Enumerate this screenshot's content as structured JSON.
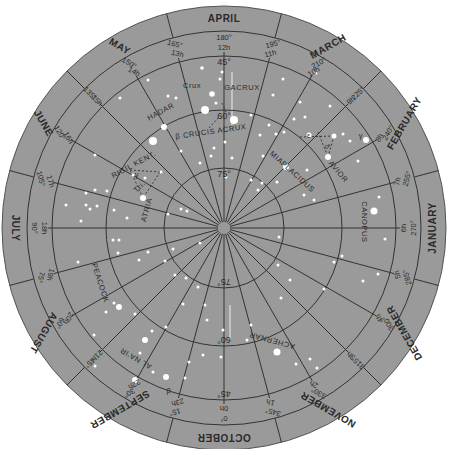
{
  "chart": {
    "center": {
      "x": 224,
      "y": 228
    },
    "colors": {
      "disc": "#9a9a9a",
      "lines": "#333333",
      "stars": "#ffffff",
      "labels": "#2a2a2a",
      "background": "#ffffff"
    },
    "months": [
      {
        "label": "APRIL",
        "angle": 180
      },
      {
        "label": "MARCH",
        "angle": 210
      },
      {
        "label": "FEBRUARY",
        "angle": 240
      },
      {
        "label": "JANUARY",
        "angle": 270
      },
      {
        "label": "DECEMBER",
        "angle": 300
      },
      {
        "label": "NOVEMBER",
        "angle": 330
      },
      {
        "label": "OCTOBER",
        "angle": 0
      },
      {
        "label": "SEPTEMBER",
        "angle": 30
      },
      {
        "label": "AUGUST",
        "angle": 60
      },
      {
        "label": "JULY",
        "angle": 90
      },
      {
        "label": "JUNE",
        "angle": 120
      },
      {
        "label": "MAY",
        "angle": 150
      }
    ],
    "ra_labels": [
      {
        "deg": "0°",
        "hr": "0h",
        "angle": 0
      },
      {
        "deg": "15°",
        "hr": "23h",
        "angle": 15
      },
      {
        "deg": "30°",
        "hr": "22h",
        "angle": 30
      },
      {
        "deg": "45°",
        "hr": "21h",
        "angle": 45
      },
      {
        "deg": "60°",
        "hr": "20h",
        "angle": 60
      },
      {
        "deg": "75°",
        "hr": "19h",
        "angle": 75
      },
      {
        "deg": "90°",
        "hr": "18h",
        "angle": 90
      },
      {
        "deg": "105°",
        "hr": "17h",
        "angle": 105
      },
      {
        "deg": "120°",
        "hr": "16h",
        "angle": 120
      },
      {
        "deg": "135°",
        "hr": "15h",
        "angle": 135
      },
      {
        "deg": "150°",
        "hr": "14h",
        "angle": 150
      },
      {
        "deg": "165°",
        "hr": "13h",
        "angle": 165
      },
      {
        "deg": "180°",
        "hr": "12h",
        "angle": 180
      },
      {
        "deg": "195°",
        "hr": "11h",
        "angle": 195
      },
      {
        "deg": "210°",
        "hr": "10h",
        "angle": 210
      },
      {
        "deg": "225°",
        "hr": "9h",
        "angle": 225
      },
      {
        "deg": "240°",
        "hr": "8h",
        "angle": 240
      },
      {
        "deg": "255°",
        "hr": "7h",
        "angle": 255
      },
      {
        "deg": "270°",
        "hr": "6h",
        "angle": 270
      },
      {
        "deg": "285°",
        "hr": "5h",
        "angle": 285
      },
      {
        "deg": "300°",
        "hr": "4h",
        "angle": 300
      },
      {
        "deg": "315°",
        "hr": "3h",
        "angle": 315
      },
      {
        "deg": "330°",
        "hr": "2h",
        "angle": 330
      },
      {
        "deg": "345°",
        "hr": "1h",
        "angle": 345
      }
    ],
    "declination_rings": [
      {
        "label": "45°",
        "radius": 172
      },
      {
        "label": "60°",
        "radius": 118
      },
      {
        "label": "75°",
        "radius": 60
      }
    ],
    "star_names": [
      {
        "name": "GACRUX",
        "x": 242,
        "y": 88,
        "rot": 0
      },
      {
        "name": "Crux",
        "x": 192,
        "y": 86,
        "rot": 0
      },
      {
        "name": "HADAR",
        "x": 161,
        "y": 112,
        "rot": -28
      },
      {
        "name": "β CRUCIS ACRUX",
        "x": 211,
        "y": 132,
        "rot": -8
      },
      {
        "name": "RIGIL KENT.",
        "x": 134,
        "y": 165,
        "rot": -28
      },
      {
        "name": "ATRIA",
        "x": 147,
        "y": 210,
        "rot": -75
      },
      {
        "name": "PEACOCK",
        "x": 100,
        "y": 283,
        "rot": 72
      },
      {
        "name": "AL NA'IR",
        "x": 136,
        "y": 358,
        "rot": 210
      },
      {
        "name": "β",
        "x": 169,
        "y": 391,
        "rot": 0
      },
      {
        "name": "ACHERNAR",
        "x": 272,
        "y": 340,
        "rot": 195
      },
      {
        "name": "CANOPUS",
        "x": 364,
        "y": 222,
        "rot": 90
      },
      {
        "name": "MIAPLACIDUS",
        "x": 292,
        "y": 172,
        "rot": 42
      },
      {
        "name": "AVIOR",
        "x": 338,
        "y": 172,
        "rot": 50
      },
      {
        "name": "γ",
        "x": 361,
        "y": 136,
        "rot": 0
      },
      {
        "name": "ε",
        "x": 309,
        "y": 136,
        "rot": 0
      },
      {
        "name": "δ",
        "x": 327,
        "y": 147,
        "rot": 60
      },
      {
        "name": "γ",
        "x": 137,
        "y": 175,
        "rot": 0
      },
      {
        "name": "Tri.",
        "x": 140,
        "y": 187,
        "rot": -45
      }
    ],
    "stars": [
      {
        "x": 202,
        "y": 68,
        "r": 1.8
      },
      {
        "x": 222,
        "y": 72,
        "r": 1.5
      },
      {
        "x": 220,
        "y": 79,
        "r": 1.5
      },
      {
        "x": 283,
        "y": 79,
        "r": 1.5
      },
      {
        "x": 168,
        "y": 96,
        "r": 1.5
      },
      {
        "x": 212,
        "y": 94,
        "r": 2.8
      },
      {
        "x": 205,
        "y": 110,
        "r": 4
      },
      {
        "x": 216,
        "y": 103,
        "r": 1.5
      },
      {
        "x": 234,
        "y": 120,
        "r": 4
      },
      {
        "x": 176,
        "y": 98,
        "r": 1.5
      },
      {
        "x": 153,
        "y": 141,
        "r": 4
      },
      {
        "x": 164,
        "y": 127,
        "r": 3
      },
      {
        "x": 181,
        "y": 151,
        "r": 1.5
      },
      {
        "x": 225,
        "y": 142,
        "r": 1.5
      },
      {
        "x": 214,
        "y": 148,
        "r": 1.5
      },
      {
        "x": 211,
        "y": 156,
        "r": 1.5
      },
      {
        "x": 260,
        "y": 135,
        "r": 1.5
      },
      {
        "x": 251,
        "y": 115,
        "r": 1.5
      },
      {
        "x": 232,
        "y": 158,
        "r": 1.5
      },
      {
        "x": 200,
        "y": 163,
        "r": 1.5
      },
      {
        "x": 226,
        "y": 177,
        "r": 1.5
      },
      {
        "x": 273,
        "y": 95,
        "r": 1.5
      },
      {
        "x": 300,
        "y": 102,
        "r": 1.5
      },
      {
        "x": 316,
        "y": 73,
        "r": 1.5
      },
      {
        "x": 269,
        "y": 125,
        "r": 1.5
      },
      {
        "x": 276,
        "y": 134,
        "r": 1.5
      },
      {
        "x": 284,
        "y": 132,
        "r": 1.5
      },
      {
        "x": 294,
        "y": 119,
        "r": 1.5
      },
      {
        "x": 305,
        "y": 117,
        "r": 1.5
      },
      {
        "x": 309,
        "y": 135,
        "r": 2.5
      },
      {
        "x": 334,
        "y": 136,
        "r": 2.5
      },
      {
        "x": 343,
        "y": 134,
        "r": 1.5
      },
      {
        "x": 328,
        "y": 157,
        "r": 3
      },
      {
        "x": 350,
        "y": 141,
        "r": 1.5
      },
      {
        "x": 366,
        "y": 140,
        "r": 3
      },
      {
        "x": 286,
        "y": 167,
        "r": 3
      },
      {
        "x": 307,
        "y": 170,
        "r": 1.5
      },
      {
        "x": 358,
        "y": 161,
        "r": 1.5
      },
      {
        "x": 263,
        "y": 156,
        "r": 1.5
      },
      {
        "x": 277,
        "y": 182,
        "r": 1.5
      },
      {
        "x": 258,
        "y": 190,
        "r": 1.5
      },
      {
        "x": 304,
        "y": 195,
        "r": 1.5
      },
      {
        "x": 374,
        "y": 211,
        "r": 3.5
      },
      {
        "x": 379,
        "y": 197,
        "r": 1.5
      },
      {
        "x": 385,
        "y": 239,
        "r": 1.5
      },
      {
        "x": 342,
        "y": 256,
        "r": 1.5
      },
      {
        "x": 378,
        "y": 274,
        "r": 1.5
      },
      {
        "x": 363,
        "y": 281,
        "r": 1.5
      },
      {
        "x": 334,
        "y": 262,
        "r": 1.5
      },
      {
        "x": 324,
        "y": 289,
        "r": 1.5
      },
      {
        "x": 279,
        "y": 237,
        "r": 1.5
      },
      {
        "x": 278,
        "y": 265,
        "r": 1.5
      },
      {
        "x": 290,
        "y": 280,
        "r": 1.5
      },
      {
        "x": 281,
        "y": 298,
        "r": 1.5
      },
      {
        "x": 314,
        "y": 200,
        "r": 1.5
      },
      {
        "x": 247,
        "y": 340,
        "r": 1.5
      },
      {
        "x": 277,
        "y": 352,
        "r": 3.5
      },
      {
        "x": 251,
        "y": 325,
        "r": 1.5
      },
      {
        "x": 207,
        "y": 320,
        "r": 1.5
      },
      {
        "x": 223,
        "y": 330,
        "r": 1.5
      },
      {
        "x": 221,
        "y": 357,
        "r": 1.5
      },
      {
        "x": 203,
        "y": 355,
        "r": 1.5
      },
      {
        "x": 189,
        "y": 362,
        "r": 1.5
      },
      {
        "x": 310,
        "y": 359,
        "r": 1.5
      },
      {
        "x": 296,
        "y": 364,
        "r": 1.5
      },
      {
        "x": 317,
        "y": 368,
        "r": 1.5
      },
      {
        "x": 186,
        "y": 278,
        "r": 1.5
      },
      {
        "x": 198,
        "y": 287,
        "r": 1.5
      },
      {
        "x": 183,
        "y": 304,
        "r": 1.5
      },
      {
        "x": 166,
        "y": 327,
        "r": 1.5
      },
      {
        "x": 152,
        "y": 331,
        "r": 1.5
      },
      {
        "x": 145,
        "y": 340,
        "r": 3
      },
      {
        "x": 140,
        "y": 353,
        "r": 1.5
      },
      {
        "x": 153,
        "y": 372,
        "r": 1.5
      },
      {
        "x": 95,
        "y": 366,
        "r": 1.5
      },
      {
        "x": 135,
        "y": 380,
        "r": 3
      },
      {
        "x": 166,
        "y": 377,
        "r": 3
      },
      {
        "x": 185,
        "y": 378,
        "r": 1.5
      },
      {
        "x": 119,
        "y": 307,
        "r": 3
      },
      {
        "x": 135,
        "y": 314,
        "r": 1.5
      },
      {
        "x": 165,
        "y": 261,
        "r": 1.5
      },
      {
        "x": 175,
        "y": 275,
        "r": 1.5
      },
      {
        "x": 148,
        "y": 252,
        "r": 1.5
      },
      {
        "x": 168,
        "y": 214,
        "r": 1.5
      },
      {
        "x": 173,
        "y": 249,
        "r": 1.5
      },
      {
        "x": 200,
        "y": 243,
        "r": 1.5
      },
      {
        "x": 113,
        "y": 240,
        "r": 1.5
      },
      {
        "x": 118,
        "y": 253,
        "r": 1.5
      },
      {
        "x": 139,
        "y": 260,
        "r": 1.5
      },
      {
        "x": 78,
        "y": 262,
        "r": 1.5
      },
      {
        "x": 114,
        "y": 303,
        "r": 1.5
      },
      {
        "x": 94,
        "y": 335,
        "r": 1.5
      },
      {
        "x": 106,
        "y": 312,
        "r": 1.5
      },
      {
        "x": 114,
        "y": 210,
        "r": 1.5
      },
      {
        "x": 127,
        "y": 218,
        "r": 1.5
      },
      {
        "x": 81,
        "y": 221,
        "r": 1.5
      },
      {
        "x": 86,
        "y": 205,
        "r": 1.5
      },
      {
        "x": 90,
        "y": 209,
        "r": 1.5
      },
      {
        "x": 97,
        "y": 206,
        "r": 1.5
      },
      {
        "x": 86,
        "y": 193,
        "r": 1.5
      },
      {
        "x": 95,
        "y": 190,
        "r": 1.5
      },
      {
        "x": 107,
        "y": 191,
        "r": 1.5
      },
      {
        "x": 66,
        "y": 205,
        "r": 1.5
      },
      {
        "x": 95,
        "y": 155,
        "r": 1.5
      },
      {
        "x": 145,
        "y": 178,
        "r": 1.5
      },
      {
        "x": 143,
        "y": 198,
        "r": 3
      },
      {
        "x": 161,
        "y": 172,
        "r": 1.5
      },
      {
        "x": 133,
        "y": 175,
        "r": 1.5
      },
      {
        "x": 120,
        "y": 98,
        "r": 1.5
      },
      {
        "x": 148,
        "y": 80,
        "r": 1.5
      },
      {
        "x": 251,
        "y": 180,
        "r": 1.5
      },
      {
        "x": 181,
        "y": 209,
        "r": 1.5
      },
      {
        "x": 187,
        "y": 211,
        "r": 1.5
      },
      {
        "x": 119,
        "y": 240,
        "r": 1.5
      },
      {
        "x": 205,
        "y": 305,
        "r": 1.5
      },
      {
        "x": 262,
        "y": 183,
        "r": 1.5
      },
      {
        "x": 330,
        "y": 106,
        "r": 1.5
      }
    ],
    "dashed_lines": [
      {
        "x1": 130,
        "y1": 170,
        "x2": 160,
        "y2": 172
      },
      {
        "x1": 160,
        "y1": 172,
        "x2": 143,
        "y2": 198
      },
      {
        "x1": 143,
        "y1": 198,
        "x2": 130,
        "y2": 170
      },
      {
        "x1": 300,
        "y1": 137,
        "x2": 334,
        "y2": 136
      },
      {
        "x1": 318,
        "y1": 132,
        "x2": 328,
        "y2": 157
      },
      {
        "x1": 334,
        "y1": 136,
        "x2": 328,
        "y2": 157
      },
      {
        "x1": 222,
        "y1": 103,
        "x2": 226,
        "y2": 112
      },
      {
        "x1": 209,
        "y1": 128,
        "x2": 218,
        "y2": 118
      }
    ]
  }
}
